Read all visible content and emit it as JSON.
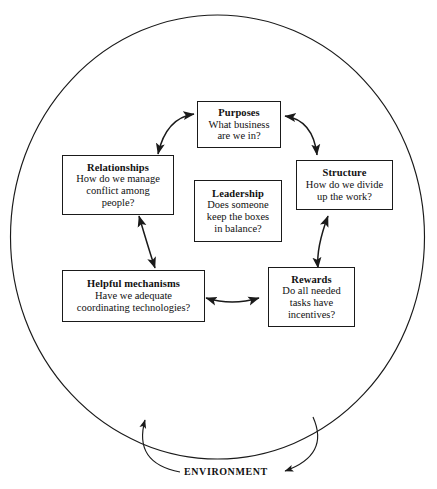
{
  "diagram": {
    "boundary_label": "ENVIRONMENT",
    "stroke_color": "#1a1a1a",
    "background_color": "#ffffff",
    "boxes": [
      {
        "id": "purposes",
        "title": "Purposes",
        "lines": [
          "What business",
          "are we in?"
        ]
      },
      {
        "id": "relationships",
        "title": "Relationships",
        "lines": [
          "How do we manage",
          "conflict among",
          "people?"
        ]
      },
      {
        "id": "structure",
        "title": "Structure",
        "lines": [
          "How do we divide",
          "up the work?"
        ]
      },
      {
        "id": "leadership",
        "title": "Leadership",
        "lines": [
          "Does someone",
          "keep the boxes",
          "in balance?"
        ]
      },
      {
        "id": "helpful-mechanisms",
        "title": "Helpful mechanisms",
        "lines": [
          "Have we adequate",
          "coordinating technologies?"
        ]
      },
      {
        "id": "rewards",
        "title": "Rewards",
        "lines": [
          "Do all needed",
          "tasks have",
          "incentives?"
        ]
      }
    ],
    "connections": [
      {
        "from": "relationships",
        "to": "purposes",
        "style": "double-headed-curve"
      },
      {
        "from": "purposes",
        "to": "structure",
        "style": "double-headed-curve"
      },
      {
        "from": "structure",
        "to": "rewards",
        "style": "double-headed-curve"
      },
      {
        "from": "rewards",
        "to": "helpful-mechanisms",
        "style": "double-headed-curve"
      },
      {
        "from": "helpful-mechanisms",
        "to": "relationships",
        "style": "double-headed-curve"
      },
      {
        "from": "environment",
        "to": "organization",
        "style": "feedback-arrow"
      }
    ]
  }
}
